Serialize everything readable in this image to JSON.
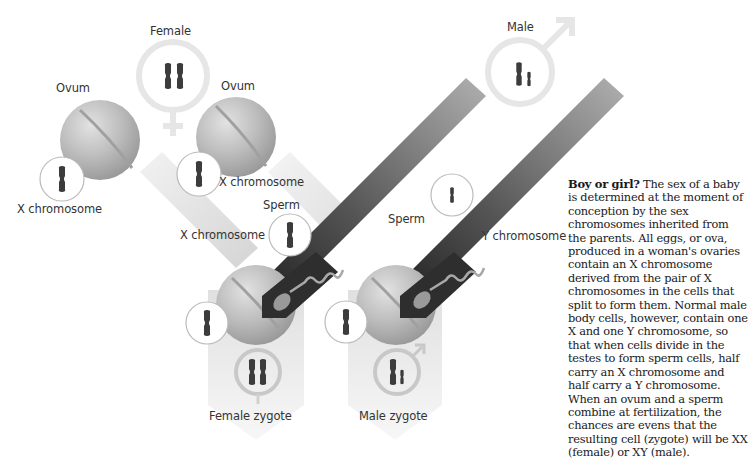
{
  "labels": {
    "female": "Female",
    "male": "Male",
    "ovum_left": "Ovum",
    "ovum_right": "Ovum",
    "x_chromosome_ovum_left": "X chromosome",
    "x_chromosome_ovum_right": "X chromosome",
    "sperm_left": "Sperm",
    "sperm_right": "Sperm",
    "x_chromosome_sperm": "X chromosome",
    "y_chromosome_sperm": "Y chromosome",
    "female_zygote": "Female zygote",
    "male_zygote": "Male zygote"
  },
  "caption": {
    "heading": "Boy or girl?",
    "body": " The sex of a baby is determined at the moment of conception by the sex chromosomes inherited from the parents. All eggs, or ova, produced in a woman's ovaries contain an X chromosome derived from the pair of X chromosomes in the cells that split to form them. Normal male body cells, however, contain one X and one Y chromosome, so that when cells divide in the testes to form sperm cells, half carry an X chromosome and half carry a Y chromosome. When an ovum and a sperm combine at fertilization, the chances are evens that the resulting cell (zygote) will be XX (female) or XY (male)."
  },
  "icons": {
    "female_symbol": "venus-symbol",
    "male_symbol": "mars-symbol"
  },
  "colors": {
    "ovum": "#b8b8b8",
    "sperm_band": "#2e2e2e",
    "female_band": "#d8d8d8",
    "chromosome": "#3c3c3c",
    "y_chromosome": "#222222"
  }
}
